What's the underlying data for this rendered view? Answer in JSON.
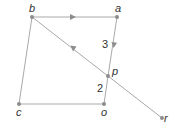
{
  "diagram": {
    "type": "vector-geometry",
    "colors": {
      "line": "#a9a9a9",
      "point": "#8c8c8c",
      "label": "#333333"
    },
    "points": [
      {
        "id": "b",
        "label": "b",
        "x": 32,
        "y": 17
      },
      {
        "id": "a",
        "label": "a",
        "x": 117,
        "y": 17
      },
      {
        "id": "p",
        "label": "p",
        "x": 108,
        "y": 76
      },
      {
        "id": "o",
        "label": "o",
        "x": 104,
        "y": 104
      },
      {
        "id": "c",
        "label": "c",
        "x": 19,
        "y": 104
      },
      {
        "id": "r",
        "label": "r",
        "x": 162,
        "y": 118
      }
    ],
    "segments": [
      {
        "from": "b",
        "to": "a",
        "arrow": "toward a"
      },
      {
        "from": "a",
        "to": "p",
        "arrow": "toward p"
      },
      {
        "from": "p",
        "to": "o",
        "arrow": "none"
      },
      {
        "from": "o",
        "to": "c",
        "arrow": "none"
      },
      {
        "from": "c",
        "to": "b",
        "arrow": "none"
      },
      {
        "from": "b",
        "to": "r",
        "arrow": "present; direction unresolved from screenshot",
        "passes_through": "p"
      }
    ],
    "ratio_labels": [
      {
        "text": "3",
        "segment": "a-p"
      },
      {
        "text": "2",
        "segment": "p-o"
      }
    ]
  }
}
